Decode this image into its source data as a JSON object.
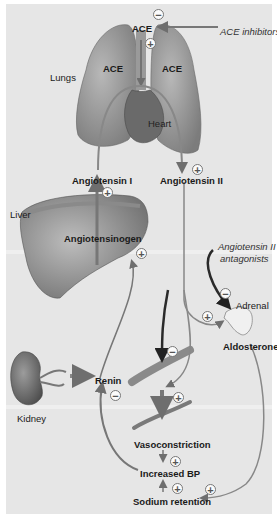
{
  "figure": {
    "organs": {
      "lungs": "Lungs",
      "heart": "Heart",
      "liver": "Liver",
      "kidney": "Kidney",
      "adrenal": "Adrenal"
    },
    "enzymes": {
      "ace_top": "ACE",
      "ace_left": "ACE",
      "ace_right": "ACE"
    },
    "molecules": {
      "angiotensin_1": "Angiotensin I",
      "angiotensin_2": "Angiotensin II",
      "angiotensinogen": "Angiotensinogen",
      "renin": "Renin",
      "aldosterone": "Aldosterone"
    },
    "drugs": {
      "ace_inhibitors": "ACE inhibitors",
      "at2_antagonists_line1": "Angiotensin II",
      "at2_antagonists_line2": "antagonists"
    },
    "effects": {
      "vasoconstriction": "Vasoconstriction",
      "increased_bp": "Increased BP",
      "sodium_retention": "Sodium retention"
    },
    "signs": {
      "plus": "+",
      "minus": "−"
    },
    "colors": {
      "background": "#e6e6e6",
      "organ_fill": "#9a9a9a",
      "arrow": "#6e6e6e",
      "dark_arrow": "#2a2a2a",
      "text": "#1a1a1a"
    }
  }
}
